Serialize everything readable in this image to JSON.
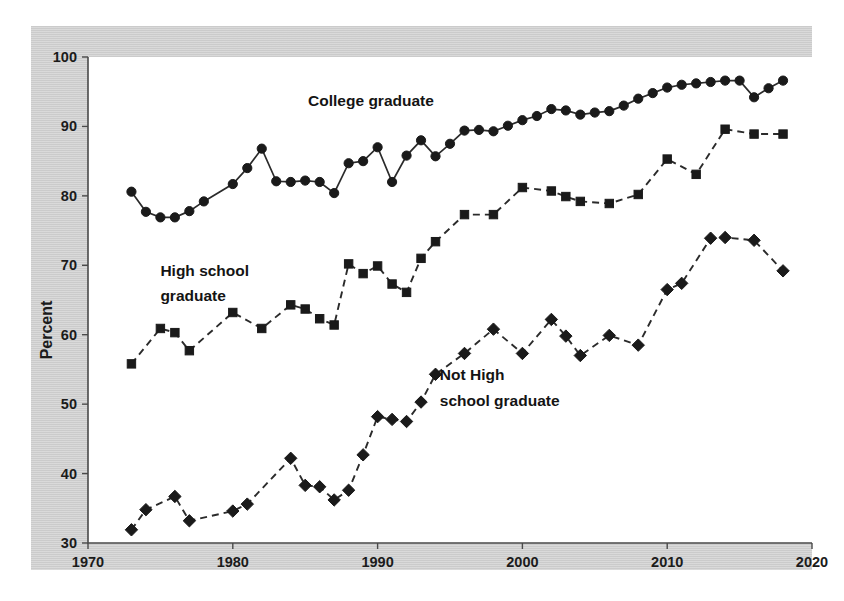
{
  "chart_data": {
    "type": "line",
    "title": "",
    "xlabel": "",
    "ylabel": "Percent",
    "xlim": [
      1970,
      2020
    ],
    "ylim": [
      30,
      100
    ],
    "xticks": [
      1970,
      1980,
      1990,
      2000,
      2010,
      2020
    ],
    "yticks": [
      30,
      40,
      50,
      60,
      70,
      80,
      90,
      100
    ],
    "grid": false,
    "legend_position": "inline-annotations",
    "annotations": [
      {
        "text": "College graduate",
        "x": 1985.2,
        "y": 93.0
      },
      {
        "text": "High school",
        "x": 1975.0,
        "y": 68.5
      },
      {
        "text": "graduate",
        "x": 1975.0,
        "y": 64.8
      },
      {
        "text": "Not High",
        "x": 1994.3,
        "y": 53.5
      },
      {
        "text": "school graduate",
        "x": 1994.3,
        "y": 49.8
      }
    ],
    "series": [
      {
        "name": "College graduate",
        "marker": "circle",
        "linestyle": "solid",
        "color": "#1a1a1a",
        "x": [
          1973,
          1974,
          1975,
          1976,
          1977,
          1978,
          1980,
          1981,
          1982,
          1983,
          1984,
          1985,
          1986,
          1987,
          1988,
          1989,
          1990,
          1991,
          1992,
          1993,
          1994,
          1995,
          1996,
          1997,
          1998,
          1999,
          2000,
          2001,
          2002,
          2003,
          2004,
          2005,
          2006,
          2007,
          2008,
          2009,
          2010,
          2011,
          2012,
          2013,
          2014,
          2015,
          2016,
          2017,
          2018
        ],
        "values": [
          80.6,
          77.7,
          76.9,
          76.9,
          77.8,
          79.2,
          81.7,
          84.0,
          86.8,
          82.1,
          82.0,
          82.2,
          82.0,
          80.4,
          84.7,
          85.0,
          87.0,
          82.0,
          85.8,
          88.0,
          85.7,
          87.5,
          89.4,
          89.5,
          89.3,
          90.1,
          90.9,
          91.5,
          92.5,
          92.3,
          91.7,
          92.0,
          92.2,
          93.0,
          94.0,
          94.8,
          95.6,
          96.0,
          96.2,
          96.4,
          96.6,
          96.6,
          94.2,
          95.5,
          96.6
        ]
      },
      {
        "name": "High school graduate",
        "marker": "square",
        "linestyle": "dashed",
        "color": "#1a1a1a",
        "x": [
          1973,
          1975,
          1976,
          1977,
          1980,
          1982,
          1984,
          1985,
          1986,
          1987,
          1988,
          1989,
          1990,
          1991,
          1992,
          1993,
          1994,
          1996,
          1998,
          2000,
          2002,
          2003,
          2004,
          2006,
          2008,
          2010,
          2012,
          2014,
          2016,
          2018
        ],
        "values": [
          55.8,
          60.9,
          60.3,
          57.7,
          63.2,
          60.9,
          64.3,
          63.7,
          62.3,
          61.4,
          70.2,
          68.8,
          69.9,
          67.3,
          66.1,
          71.0,
          73.4,
          77.3,
          77.3,
          81.2,
          80.7,
          79.9,
          79.2,
          78.9,
          80.2,
          85.3,
          83.1,
          89.6,
          88.9,
          88.9
        ]
      },
      {
        "name": "Not High school graduate",
        "marker": "diamond",
        "linestyle": "dashed",
        "color": "#1a1a1a",
        "x": [
          1973,
          1974,
          1976,
          1977,
          1980,
          1981,
          1984,
          1985,
          1986,
          1987,
          1988,
          1989,
          1990,
          1991,
          1992,
          1993,
          1994,
          1996,
          1998,
          2000,
          2002,
          2003,
          2004,
          2006,
          2008,
          2010,
          2011,
          2013,
          2014,
          2016,
          2018
        ],
        "values": [
          31.9,
          34.8,
          36.7,
          33.2,
          34.6,
          35.6,
          42.2,
          38.3,
          38.1,
          36.2,
          37.6,
          42.7,
          48.2,
          47.8,
          47.5,
          50.3,
          54.3,
          57.3,
          60.8,
          57.3,
          62.2,
          59.8,
          57.0,
          59.9,
          58.5,
          66.5,
          67.4,
          73.9,
          74.0,
          73.6,
          69.2
        ]
      }
    ]
  },
  "axes": {
    "ylabel": "Percent",
    "xtick_labels": [
      "1970",
      "1980",
      "1990",
      "2000",
      "2010",
      "2020"
    ],
    "ytick_labels": [
      "30",
      "40",
      "50",
      "60",
      "70",
      "80",
      "90",
      "100"
    ]
  },
  "colors": {
    "panel_background": "#cfcfcf",
    "plot_background": "#ffffff",
    "ink": "#1a1a1a",
    "axis": "#4a4a4a",
    "page_background": "#ffffff"
  }
}
